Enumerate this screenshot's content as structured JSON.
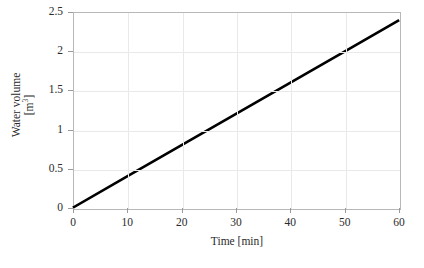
{
  "chart_data": {
    "type": "line",
    "title": "",
    "xlabel": "Time [min]",
    "ylabel_line1": "Water volume",
    "ylabel_line2": "[m³]",
    "ylabel_base": "[m",
    "ylabel_exponent": "3",
    "ylabel_close": "]",
    "xlim": [
      0,
      60
    ],
    "ylim": [
      0,
      2.5
    ],
    "xticks": [
      0,
      10,
      20,
      30,
      40,
      50,
      60
    ],
    "xtick_labels": [
      "0",
      "10",
      "20",
      "30",
      "40",
      "50",
      "60"
    ],
    "yticks": [
      0,
      0.5,
      1,
      1.5,
      2,
      2.5
    ],
    "ytick_labels": [
      "0",
      "0.5",
      "1",
      "1.5",
      "2",
      "2.5"
    ],
    "grid": true,
    "legend": "none",
    "series": [
      {
        "name": "Water volume",
        "color": "#000000",
        "linewidth": 2.6,
        "slope_per_min": 0.04,
        "x": [
          0,
          10,
          20,
          30,
          40,
          50,
          60
        ],
        "values": [
          0,
          0.4,
          0.8,
          1.2,
          1.6,
          2.0,
          2.4
        ]
      }
    ],
    "colors": {
      "line": "#000000",
      "grid": "#e9e9e9",
      "frame": "#b8b8b8",
      "tick": "#9a9a9a",
      "text": "#2b2b2b",
      "background": "#ffffff"
    }
  }
}
